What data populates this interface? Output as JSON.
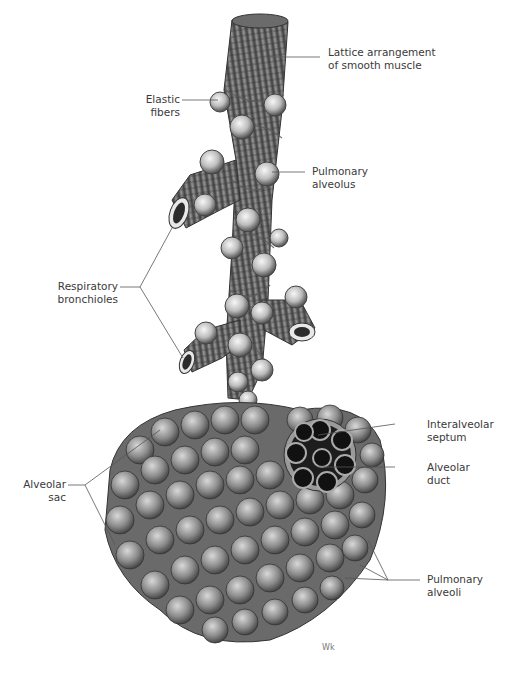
{
  "figure": {
    "labels": [
      {
        "id": "lattice",
        "line1": "Lattice arrangement",
        "line2": "of smooth muscle"
      },
      {
        "id": "elastic",
        "line1": "Elastic",
        "line2": "fibers"
      },
      {
        "id": "pulm_alveolus",
        "line1": "Pulmonary",
        "line2": "alveolus"
      },
      {
        "id": "resp_bronch",
        "line1": "Respiratory",
        "line2": "bronchioles"
      },
      {
        "id": "interalveolar",
        "line1": "Interalveolar",
        "line2": "septum"
      },
      {
        "id": "alv_duct",
        "line1": "Alveolar",
        "line2": "duct"
      },
      {
        "id": "alv_sac",
        "line1": "Alveolar",
        "line2": "sac"
      },
      {
        "id": "pulm_alveoli",
        "line1": "Pulmonary",
        "line2": "alveoli"
      }
    ],
    "signature": "Wk",
    "colors": {
      "line": "#555555",
      "text": "#3a3a3a",
      "tissue_dark": "#4a4a4a",
      "tissue_mid": "#8a8a8a",
      "tissue_light": "#e6e6e6"
    }
  }
}
